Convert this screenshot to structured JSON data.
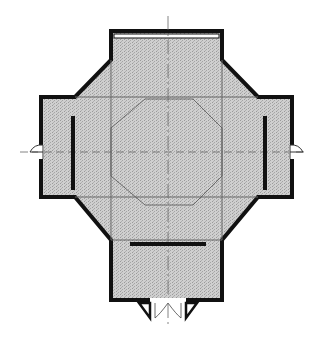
{
  "diagram": {
    "type": "architectural-floor-plan",
    "shape": "cross-plan with chamfered corners and inner octagon",
    "colors": {
      "background": "#ffffff",
      "fill": "#c8c8c8",
      "wall": "#111111",
      "grid_line": "#555555",
      "axis_line": "#666666"
    },
    "elements": [
      "exterior-walls",
      "inner-octagon-outline",
      "structural-grid-lines",
      "center-axis-lines",
      "top-window",
      "left-interior-wall",
      "right-interior-wall",
      "bottom-interior-wall",
      "left-door",
      "right-door",
      "bottom-double-door"
    ]
  }
}
